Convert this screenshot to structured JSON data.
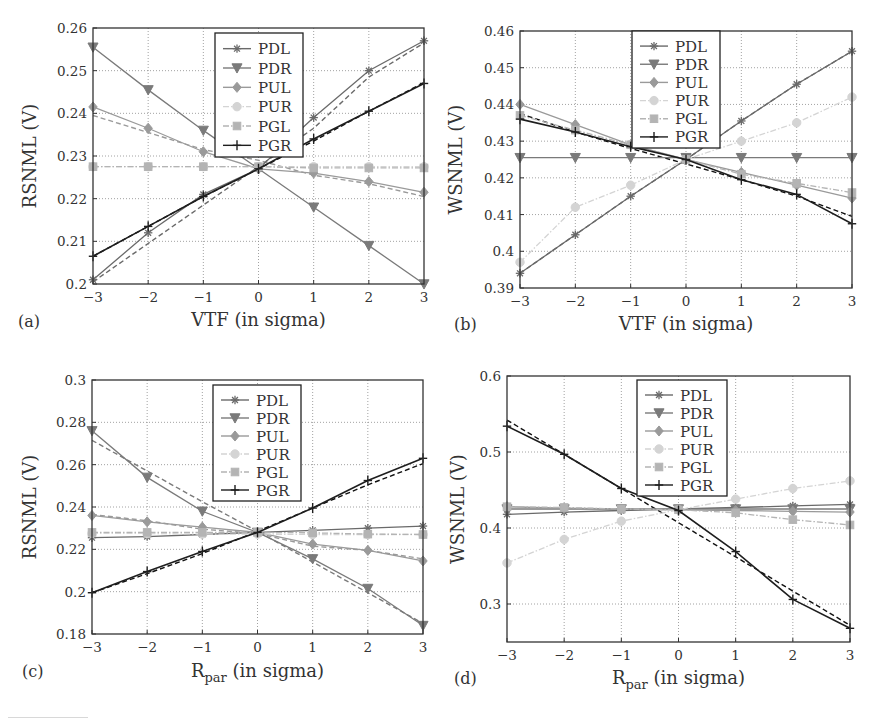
{
  "figure": {
    "panels": [
      "(a)",
      "(b)",
      "(c)",
      "(d)"
    ]
  },
  "styles": {
    "PDL": {
      "color": "#6a6a6a",
      "marker": "star",
      "dash": "solid"
    },
    "PDR": {
      "color": "#7a7a7a",
      "marker": "triangle-down",
      "dash": "solid"
    },
    "PUL": {
      "color": "#9a9a9a",
      "marker": "diamond",
      "dash": "solid"
    },
    "PUR": {
      "color": "#d4d4d4",
      "marker": "circle",
      "dash": "dashdot"
    },
    "PGL": {
      "color": "#b4b4b4",
      "marker": "square",
      "dash": "dashdot"
    },
    "PGR": {
      "color": "#1e1e1e",
      "marker": "plus",
      "dash": "solid"
    }
  },
  "chart_data": [
    {
      "type": "line",
      "panel_label": "(a)",
      "title": "",
      "xlabel": "VTF (in sigma)",
      "ylabel": "RSNML (V)",
      "x": [
        -3,
        -2,
        -1,
        0,
        1,
        2,
        3
      ],
      "xlim": [
        -3,
        3
      ],
      "ylim": [
        0.2,
        0.26
      ],
      "xticks": [
        "−3",
        "−2",
        "−1",
        "0",
        "1",
        "2",
        "3"
      ],
      "yticks": [
        0.2,
        0.21,
        0.22,
        0.23,
        0.24,
        0.25,
        0.26
      ],
      "ytick_labels": [
        "0.2",
        "0.21",
        "0.22",
        "0.23",
        "0.24",
        "0.25",
        "0.26"
      ],
      "grid": true,
      "legend_position": "upper center",
      "series": [
        {
          "name": "PDL",
          "values": [
            0.201,
            0.212,
            0.221,
            0.227,
            0.239,
            0.25,
            0.257
          ]
        },
        {
          "name": "PDR",
          "values": [
            0.2555,
            0.2455,
            0.236,
            0.227,
            0.218,
            0.209,
            0.2
          ]
        },
        {
          "name": "PUL",
          "values": [
            0.2415,
            0.2365,
            0.231,
            0.227,
            0.226,
            0.224,
            0.2215
          ]
        },
        {
          "name": "PUR",
          "values": [
            0.2275,
            0.2275,
            0.2275,
            0.2275,
            0.2275,
            0.2275,
            0.2275
          ]
        },
        {
          "name": "PGL",
          "values": [
            0.2275,
            0.2275,
            0.2275,
            0.2275,
            0.2272,
            0.2272,
            0.2272
          ]
        },
        {
          "name": "PGR",
          "values": [
            0.2065,
            0.2135,
            0.2205,
            0.227,
            0.234,
            0.2405,
            0.247
          ]
        }
      ],
      "fit_lines": [
        {
          "name": "PDL",
          "values": [
            0.2005,
            0.2095,
            0.2185,
            0.2275,
            0.2365,
            0.2485,
            0.2565
          ]
        },
        {
          "name": "PUL",
          "values": [
            0.2395,
            0.2355,
            0.2315,
            0.229,
            0.2255,
            0.2235,
            0.2205
          ]
        },
        {
          "name": "PGR",
          "values": [
            0.2065,
            0.2135,
            0.2205,
            0.227,
            0.2335,
            0.2405,
            0.2472
          ]
        }
      ]
    },
    {
      "type": "line",
      "panel_label": "(b)",
      "title": "",
      "xlabel": "VTF (in sigma)",
      "ylabel": "WSNML (V)",
      "x": [
        -3,
        -2,
        -1,
        0,
        1,
        2,
        3
      ],
      "xlim": [
        -3,
        3
      ],
      "ylim": [
        0.39,
        0.46
      ],
      "xticks": [
        "−3",
        "−2",
        "−1",
        "0",
        "1",
        "2",
        "3"
      ],
      "yticks": [
        0.39,
        0.4,
        0.41,
        0.42,
        0.43,
        0.44,
        0.45,
        0.46
      ],
      "ytick_labels": [
        "0.39",
        "0.4",
        "0.41",
        "0.42",
        "0.43",
        "0.44",
        "0.45",
        "0.46"
      ],
      "grid": true,
      "legend_position": "upper center",
      "series": [
        {
          "name": "PDL",
          "values": [
            0.394,
            0.4045,
            0.415,
            0.425,
            0.4355,
            0.4455,
            0.4545
          ]
        },
        {
          "name": "PDR",
          "values": [
            0.4255,
            0.4255,
            0.4255,
            0.4255,
            0.4255,
            0.4255,
            0.4255
          ]
        },
        {
          "name": "PUL",
          "values": [
            0.44,
            0.4345,
            0.429,
            0.425,
            0.4215,
            0.418,
            0.4145
          ]
        },
        {
          "name": "PUR",
          "values": [
            0.397,
            0.412,
            0.418,
            0.425,
            0.43,
            0.435,
            0.442
          ]
        },
        {
          "name": "PGL",
          "values": [
            0.437,
            0.433,
            0.429,
            0.425,
            0.421,
            0.4185,
            0.416
          ]
        },
        {
          "name": "PGR",
          "values": [
            0.436,
            0.4325,
            0.4285,
            0.425,
            0.4195,
            0.4155,
            0.4075
          ]
        }
      ],
      "fit_lines": [
        {
          "name": "PDL",
          "values": [
            0.394,
            0.4045,
            0.415,
            0.425,
            0.4355,
            0.4455,
            0.4545
          ]
        },
        {
          "name": "PGR",
          "values": [
            0.4375,
            0.4325,
            0.428,
            0.4238,
            0.4195,
            0.415,
            0.4095
          ]
        }
      ]
    },
    {
      "type": "line",
      "panel_label": "(c)",
      "title": "",
      "xlabel": "R_par (in sigma)",
      "xlabel_main": "R",
      "xlabel_sub": "par",
      "xlabel_rest": " (in sigma)",
      "ylabel": "RSNML (V)",
      "x": [
        -3,
        -2,
        -1,
        0,
        1,
        2,
        3
      ],
      "xlim": [
        -3,
        3
      ],
      "ylim": [
        0.18,
        0.3
      ],
      "xticks": [
        "−3",
        "−2",
        "−1",
        "0",
        "1",
        "2",
        "3"
      ],
      "yticks": [
        0.18,
        0.2,
        0.22,
        0.24,
        0.26,
        0.28,
        0.3
      ],
      "ytick_labels": [
        "0.18",
        "0.2",
        "0.22",
        "0.24",
        "0.26",
        "0.28",
        "0.3"
      ],
      "grid": true,
      "legend_position": "upper center",
      "series": [
        {
          "name": "PDL",
          "values": [
            0.2255,
            0.226,
            0.227,
            0.228,
            0.229,
            0.23,
            0.231
          ]
        },
        {
          "name": "PDR",
          "values": [
            0.276,
            0.254,
            0.238,
            0.228,
            0.2155,
            0.2015,
            0.184
          ]
        },
        {
          "name": "PUL",
          "values": [
            0.236,
            0.233,
            0.2305,
            0.228,
            0.2225,
            0.2195,
            0.2145
          ]
        },
        {
          "name": "PUR",
          "values": [
            0.2275,
            0.2275,
            0.2272,
            0.2272,
            0.227,
            0.227,
            0.227
          ]
        },
        {
          "name": "PGL",
          "values": [
            0.228,
            0.228,
            0.228,
            0.228,
            0.2278,
            0.2272,
            0.227
          ]
        },
        {
          "name": "PGR",
          "values": [
            0.1995,
            0.2095,
            0.219,
            0.228,
            0.2395,
            0.2525,
            0.263
          ]
        }
      ],
      "fit_lines": [
        {
          "name": "PDR",
          "values": [
            0.2715,
            0.257,
            0.2425,
            0.2285,
            0.214,
            0.1995,
            0.185
          ]
        },
        {
          "name": "PGR",
          "values": [
            0.1995,
            0.2085,
            0.218,
            0.2285,
            0.2395,
            0.2505,
            0.2605
          ]
        },
        {
          "name": "PUL",
          "values": [
            0.2365,
            0.2335,
            0.2295,
            0.2275,
            0.2215,
            0.2195,
            0.2155
          ]
        }
      ]
    },
    {
      "type": "line",
      "panel_label": "(d)",
      "title": "",
      "xlabel": "R_par (in sigma)",
      "xlabel_main": "R",
      "xlabel_sub": "par",
      "xlabel_rest": " (in sigma)",
      "ylabel": "WSNML (V)",
      "x": [
        -3,
        -2,
        -1,
        0,
        1,
        2,
        3
      ],
      "xlim": [
        -3,
        3
      ],
      "ylim": [
        0.25,
        0.6
      ],
      "xticks": [
        "−3",
        "−2",
        "−1",
        "0",
        "1",
        "2",
        "3"
      ],
      "yticks": [
        0.3,
        0.4,
        0.5,
        0.6
      ],
      "ytick_labels": [
        "0.3",
        "0.4",
        "0.5",
        "0.6"
      ],
      "grid": true,
      "legend_position": "upper center",
      "series": [
        {
          "name": "PDL",
          "values": [
            0.418,
            0.421,
            0.423,
            0.425,
            0.427,
            0.429,
            0.431
          ]
        },
        {
          "name": "PDR",
          "values": [
            0.425,
            0.425,
            0.425,
            0.425,
            0.425,
            0.425,
            0.425
          ]
        },
        {
          "name": "PUL",
          "values": [
            0.428,
            0.426,
            0.425,
            0.424,
            0.423,
            0.422,
            0.421
          ]
        },
        {
          "name": "PUR",
          "values": [
            0.354,
            0.385,
            0.409,
            0.424,
            0.438,
            0.452,
            0.462
          ]
        },
        {
          "name": "PGL",
          "values": [
            0.428,
            0.427,
            0.425,
            0.424,
            0.42,
            0.411,
            0.404
          ]
        },
        {
          "name": "PGR",
          "values": [
            0.534,
            0.497,
            0.452,
            0.423,
            0.369,
            0.306,
            0.268
          ]
        }
      ],
      "fit_lines": [
        {
          "name": "PGR",
          "values": [
            0.542,
            0.497,
            0.452,
            0.407,
            0.362,
            0.317,
            0.272
          ]
        }
      ]
    }
  ]
}
